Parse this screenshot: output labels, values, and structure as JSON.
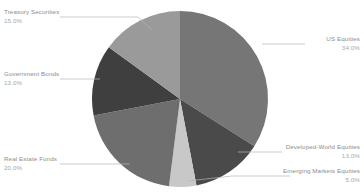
{
  "chart_data": {
    "type": "pie",
    "title": "",
    "subtitle": "",
    "xlabel": "",
    "ylabel": "",
    "legend_position": "callout-labels",
    "grid": false,
    "value_suffix": "%",
    "total": 100,
    "categories": [
      "US Equities",
      "Developed-World Equities",
      "Emerging Markets Equities",
      "Real Estate Funds",
      "Government Bonds",
      "Treasury Securities"
    ],
    "values": [
      34,
      13,
      5,
      20,
      13,
      15
    ],
    "value_labels": [
      "34.0%",
      "13.0%",
      "5.0%",
      "20.0%",
      "13.0%",
      "15.0%"
    ],
    "colors": [
      "#767676",
      "#4a4a4a",
      "#c8c8c8",
      "#6e6e6e",
      "#3f3f3f",
      "#9a9a9a"
    ],
    "start_angle_deg": 0,
    "direction": "clockwise",
    "slices": [
      {
        "label": "US Equities",
        "value": 34,
        "value_label": "34.0%",
        "color": "#767676"
      },
      {
        "label": "Developed-World Equities",
        "value": 13,
        "value_label": "13.0%",
        "color": "#4a4a4a"
      },
      {
        "label": "Emerging Markets Equities",
        "value": 5,
        "value_label": "5.0%",
        "color": "#c8c8c8"
      },
      {
        "label": "Real Estate Funds",
        "value": 20,
        "value_label": "20.0%",
        "color": "#6e6e6e"
      },
      {
        "label": "Government Bonds",
        "value": 13,
        "value_label": "13.0%",
        "color": "#3f3f3f"
      },
      {
        "label": "Treasury Securities",
        "value": 15,
        "value_label": "15.0%",
        "color": "#9a9a9a"
      }
    ]
  },
  "callouts": {
    "treasury_securities": {
      "name": "Treasury Securities",
      "pct": "15.0%"
    },
    "government_bonds": {
      "name": "Government Bonds",
      "pct": "13.0%"
    },
    "real_estate_funds": {
      "name": "Real Estate Funds",
      "pct": "20.0%"
    },
    "us_equities": {
      "name": "US Equities",
      "pct": "34.0%"
    },
    "developed_world_equities": {
      "name": "Developed-World Equities",
      "pct": "13.0%"
    },
    "emerging_markets_equities": {
      "name": "Emerging Markets Equities",
      "pct": "5.0%"
    }
  },
  "style": {
    "background": "#ffffff",
    "leader_line_color": "#b4b4b4",
    "label_text_color": "#8c8c8c",
    "pct_text_color": "#a8a8a8"
  },
  "geometry": {
    "center_x": 180,
    "center_y": 99,
    "radius": 88
  }
}
